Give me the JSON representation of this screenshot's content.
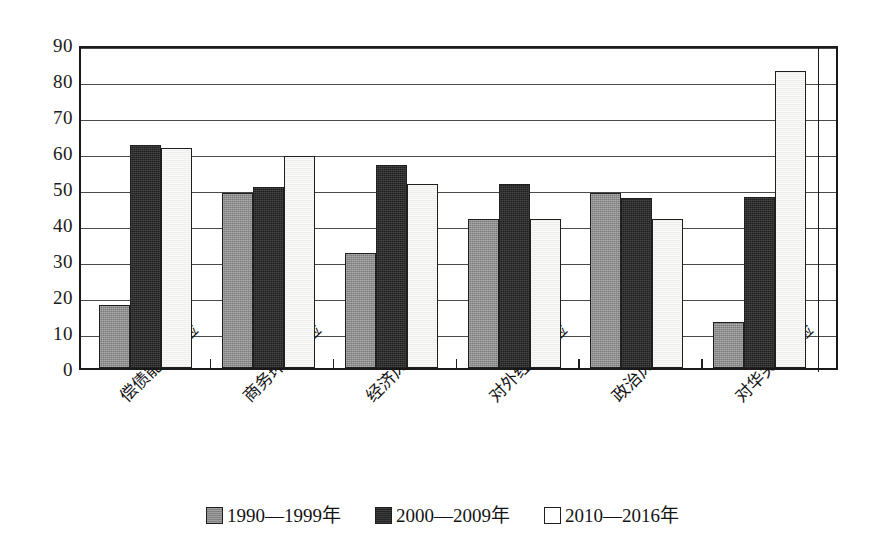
{
  "chart_data": {
    "type": "bar",
    "title": "",
    "xlabel": "",
    "ylabel": "",
    "ylim": [
      0,
      90
    ],
    "yticks": [
      0,
      10,
      20,
      30,
      40,
      50,
      60,
      70,
      80,
      90
    ],
    "grid": true,
    "legend_position": "bottom-center",
    "categories": [
      "偿债能力风险",
      "商务环境风险",
      "经济风险",
      "对外经济风险",
      "政治风险",
      "对华关系风险"
    ],
    "series": [
      {
        "name": "1990—1999年",
        "color": "#8a8a8a",
        "values": [
          17.5,
          48.5,
          32.0,
          41.5,
          48.5,
          12.8
        ]
      },
      {
        "name": "2000—2009年",
        "color": "#2e2e2e",
        "values": [
          62.0,
          50.2,
          56.5,
          51.2,
          47.3,
          47.5
        ]
      },
      {
        "name": "2010—2016年",
        "color": "#f3f3f1",
        "values": [
          61.0,
          59.0,
          51.0,
          41.5,
          41.5,
          82.5
        ]
      }
    ]
  },
  "legend": {
    "entries": [
      {
        "label": "1990—1999年"
      },
      {
        "label": "2000—2009年"
      },
      {
        "label": "2010—2016年"
      }
    ]
  },
  "axis": {
    "y_tick_labels": [
      "90",
      "80",
      "70",
      "60",
      "50",
      "40",
      "30",
      "20",
      "10",
      "0"
    ]
  }
}
